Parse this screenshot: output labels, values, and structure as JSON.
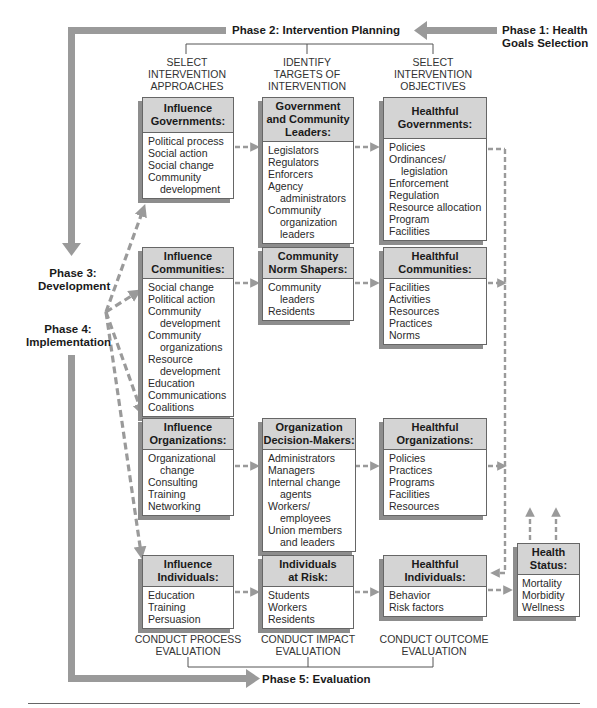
{
  "phases": {
    "phase1": "Phase 1: Health\nGoals Selection",
    "phase2": "Phase 2: Intervention Planning",
    "phase3": "Phase 3:\nDevelopment",
    "phase4": "Phase 4:\nImplementation",
    "phase5": "Phase 5: Evaluation"
  },
  "column_headers": [
    "SELECT\nINTERVENTION\nAPPROACHES",
    "IDENTIFY\nTARGETS OF\nINTERVENTION",
    "SELECT\nINTERVENTION\nOBJECTIVES"
  ],
  "rows": [
    {
      "approach": {
        "title": "Influence\nGovernments:",
        "items": [
          [
            "Political process"
          ],
          [
            "Social action"
          ],
          [
            "Social change"
          ],
          [
            "Community",
            "development"
          ]
        ]
      },
      "target": {
        "title": "Government\nand Community\nLeaders:",
        "items": [
          [
            "Legislators"
          ],
          [
            "Regulators"
          ],
          [
            "Enforcers"
          ],
          [
            "Agency",
            "administrators"
          ],
          [
            "Community",
            "organization",
            "leaders"
          ]
        ]
      },
      "objective": {
        "title": "Healthful\nGovernments:",
        "items": [
          [
            "Policies"
          ],
          [
            "Ordinances/",
            "legislation"
          ],
          [
            "Enforcement"
          ],
          [
            "Regulation"
          ],
          [
            "Resource allocation"
          ],
          [
            "Program"
          ],
          [
            "Facilities"
          ]
        ]
      }
    },
    {
      "approach": {
        "title": "Influence\nCommunities:",
        "items": [
          [
            "Social change"
          ],
          [
            "Political action"
          ],
          [
            "Community",
            "development"
          ],
          [
            "Community",
            "organizations"
          ],
          [
            "Resource",
            "development"
          ],
          [
            "Education"
          ],
          [
            "Communications"
          ],
          [
            "Coalitions"
          ]
        ]
      },
      "target": {
        "title": "Community\nNorm Shapers:",
        "items": [
          [
            "Community",
            "leaders"
          ],
          [
            "Residents"
          ]
        ]
      },
      "objective": {
        "title": "Healthful\nCommunities:",
        "items": [
          [
            "Facilities"
          ],
          [
            "Activities"
          ],
          [
            "Resources"
          ],
          [
            "Practices"
          ],
          [
            "Norms"
          ]
        ]
      }
    },
    {
      "approach": {
        "title": "Influence\nOrganizations:",
        "items": [
          [
            "Organizational",
            "change"
          ],
          [
            "Consulting"
          ],
          [
            "Training"
          ],
          [
            "Networking"
          ]
        ]
      },
      "target": {
        "title": "Organization\nDecision-Makers:",
        "items": [
          [
            "Administrators"
          ],
          [
            "Managers"
          ],
          [
            "Internal change",
            "agents"
          ],
          [
            "Workers/",
            "employees"
          ],
          [
            "Union members",
            "and leaders"
          ]
        ]
      },
      "objective": {
        "title": "Healthful\nOrganizations:",
        "items": [
          [
            "Policies"
          ],
          [
            "Practices"
          ],
          [
            "Programs"
          ],
          [
            "Facilities"
          ],
          [
            "Resources"
          ]
        ]
      }
    },
    {
      "approach": {
        "title": "Influence\nIndividuals:",
        "items": [
          [
            "Education"
          ],
          [
            "Training"
          ],
          [
            "Persuasion"
          ]
        ]
      },
      "target": {
        "title": "Individuals\nat Risk:",
        "items": [
          [
            "Students"
          ],
          [
            "Workers"
          ],
          [
            "Residents"
          ]
        ]
      },
      "objective": {
        "title": "Healthful\nIndividuals:",
        "items": [
          [
            "Behavior"
          ],
          [
            "Risk factors"
          ]
        ]
      }
    }
  ],
  "health_status": {
    "title": "Health\nStatus:",
    "items": [
      [
        "Mortality"
      ],
      [
        "Morbidity"
      ],
      [
        "Wellness"
      ]
    ]
  },
  "evaluation_headers": [
    "CONDUCT PROCESS\nEVALUATION",
    "CONDUCT IMPACT\nEVALUATION",
    "CONDUCT OUTCOME\nEVALUATION"
  ],
  "colors": {
    "bar": "#9a9a9a",
    "box_header": "#d4d4d4",
    "box_shadow": "#8d8d8d",
    "dashed": "#9a9a9a"
  }
}
